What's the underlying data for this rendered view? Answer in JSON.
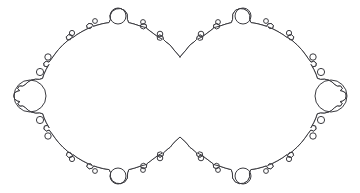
{
  "figure": {
    "kind": "line-drawing",
    "background_color": "#ffffff",
    "stroke_color": "#3b3b40",
    "stroke_width": 1,
    "canvas": {
      "width": 360,
      "height": 193
    }
  },
  "chart_data": {
    "type": "line",
    "subtitle": "",
    "xlabel": "",
    "ylabel": "",
    "grid": false,
    "legend": "none",
    "xlim": [
      0,
      360
    ],
    "ylim": [
      0,
      193
    ],
    "components": [
      {
        "name": "left-main-circle",
        "center": [
          118,
          96
        ],
        "radius": 78
      },
      {
        "name": "right-main-circle",
        "center": [
          243,
          96
        ],
        "radius": 78
      }
    ],
    "cusps": [
      {
        "name": "top-centre-cusp",
        "point": [
          180,
          57
        ]
      },
      {
        "name": "bottom-centre-cusp",
        "point": [
          180,
          137
        ]
      }
    ],
    "major_buds": [
      {
        "name": "left-outer-bud",
        "center": [
          30,
          96
        ],
        "radius": 16
      },
      {
        "name": "right-outer-bud",
        "center": [
          331,
          96
        ],
        "radius": 16
      },
      {
        "name": "left-top-bud",
        "center": [
          118,
          16
        ],
        "radius": 8
      },
      {
        "name": "right-top-bud",
        "center": [
          243,
          16
        ],
        "radius": 8
      },
      {
        "name": "left-bottom-bud",
        "center": [
          118,
          176
        ],
        "radius": 8
      },
      {
        "name": "right-bottom-bud",
        "center": [
          243,
          176
        ],
        "radius": 8
      }
    ],
    "minor_buds": [
      {
        "center": [
          48,
          57
        ],
        "radius": 3.2
      },
      {
        "center": [
          40,
          72
        ],
        "radius": 3.6
      },
      {
        "center": [
          40,
          120
        ],
        "radius": 3.6
      },
      {
        "center": [
          48,
          136
        ],
        "radius": 3.2
      },
      {
        "center": [
          72,
          33
        ],
        "radius": 2.6
      },
      {
        "center": [
          95,
          21
        ],
        "radius": 2.4
      },
      {
        "center": [
          143,
          22
        ],
        "radius": 2.4
      },
      {
        "center": [
          160,
          34
        ],
        "radius": 2.8
      },
      {
        "center": [
          95,
          171
        ],
        "radius": 2.4
      },
      {
        "center": [
          143,
          170
        ],
        "radius": 2.4
      },
      {
        "center": [
          160,
          158
        ],
        "radius": 2.8
      },
      {
        "center": [
          72,
          159
        ],
        "radius": 2.6
      },
      {
        "center": [
          313,
          57
        ],
        "radius": 3.2
      },
      {
        "center": [
          321,
          72
        ],
        "radius": 3.6
      },
      {
        "center": [
          321,
          120
        ],
        "radius": 3.6
      },
      {
        "center": [
          313,
          136
        ],
        "radius": 3.2
      },
      {
        "center": [
          289,
          33
        ],
        "radius": 2.6
      },
      {
        "center": [
          266,
          21
        ],
        "radius": 2.4
      },
      {
        "center": [
          218,
          22
        ],
        "radius": 2.4
      },
      {
        "center": [
          201,
          34
        ],
        "radius": 2.8
      },
      {
        "center": [
          266,
          171
        ],
        "radius": 2.4
      },
      {
        "center": [
          218,
          170
        ],
        "radius": 2.4
      },
      {
        "center": [
          201,
          158
        ],
        "radius": 2.8
      },
      {
        "center": [
          289,
          159
        ],
        "radius": 2.6
      }
    ],
    "path_d": "M 180 57 L 174 50 L 170 45 L 166 42 L 163.5 39.5 L 162.6 36.3 L 159.8 35.0 L 157.2 36.6 L 157.6 39.6 L 160.6 40.4 L 162.4 39.2 L 158 37 L 154 34 L 150 31 L 146.5 28.3 L 146.2 24.8 L 143.4 23.6 L 140.6 25.0 L 140.8 27.9 L 143.6 29.0 L 145.8 27.6 L 140 26 L 134 24 L 128.6 22.6 L 127.4 19.4 L 127.2 14.2 L 124.6 10.4 L 120.4 8.6 L 116.0 9.0 L 112.2 11.4 L 110.2 15.4 L 110.4 19.6 L 109.0 22.6 L 103 23.6 L 97 25.2 L 93.4 26.4 L 92.0 24.0 L 89.0 23.4 L 86.6 25.4 L 87.4 28.2 L 90.4 28.6 L 92.2 26.6 L 87 29 L 82 31.6 L 77 34.6 L 72.6 37.8 L 71.4 35.2 L 68.4 34.8 L 66.2 36.9 L 67.2 39.7 L 70.2 39.8 L 71.8 37.6 L 67 41.2 L 62.6 45.2 L 58.6 49.4 L 55 54 L 51.6 58.8 L 49.0 62.2 L 46.2 61.2 L 43.8 63.0 L 44.2 66.0 L 47.2 66.8 L 49.0 64.4 L 46.2 69.4 L 44.0 74.2 L 42.6 78.4 L 39.4 79.4 L 35.6 79.2 L 31.6 80.0 L 28.0 82.0 L 25.0 84.8 L 22.6 86.2 L 19.4 86.0 L 17.6 88.6 L 19.8 90.6 L 17.0 91.4 L 14.4 93.0 L 14.0 96.0 L 14.6 99.0 L 17.2 100.8 L 20.0 101.6 L 17.8 103.4 L 19.6 106.0 L 22.8 105.8 L 25.2 107.4 L 28.2 110.2 L 31.8 112.2 L 35.8 113.0 L 39.6 112.8 L 42.8 113.8 L 44.2 118.0 L 46.4 122.8 L 49.2 127.8 L 47.4 125.4 L 44.4 126.2 L 44.0 129.2 L 46.4 131.0 L 49.2 130.0 L 51.8 133.4 L 55.2 138.2 L 58.8 142.8 L 62.8 147.0 L 67.2 151.0 L 72.0 154.6 L 70.4 152.4 L 67.4 152.5 L 66.4 155.3 L 68.6 157.4 L 71.6 157.0 L 72.8 154.4 L 77.2 157.6 L 82.2 160.6 L 87.2 163.2 L 92.4 165.6 L 90.6 163.6 L 87.6 164.0 L 86.8 166.8 L 89.2 168.8 L 92.2 168.2 L 93.6 165.8 L 97.2 167.0 L 103.2 168.6 L 109.2 169.6 L 110.6 172.6 L 110.4 176.8 L 112.4 180.8 L 116.2 183.2 L 120.6 183.6 L 124.8 181.8 L 127.4 178.0 L 127.6 172.8 L 128.8 169.6 L 134.2 168.2 L 140.2 166.2 L 146.0 164.6 L 143.8 163.2 L 141.0 164.3 L 140.8 167.2 L 143.6 168.6 L 146.4 167.4 L 146.7 163.9 L 150.2 161.2 L 154.2 158.2 L 158.2 155.2 L 162.6 153.0 L 160.8 151.8 L 157.8 152.6 L 157.4 155.6 L 160.0 157.2 L 162.8 155.9 L 163.7 152.7 L 166.2 150.2 L 170.2 147.2 L 174.2 142.2 L 180 137 L 185.8 142.2 L 189.8 147.2 L 193.8 150.2 L 196.3 152.7 L 197.2 155.9 L 200.0 157.2 L 202.6 155.6 L 202.2 152.6 L 199.2 151.8 L 197.4 153.0 L 201.8 155.2 L 205.8 158.2 L 209.8 161.2 L 213.3 163.9 L 213.6 167.4 L 216.4 168.6 L 219.2 167.2 L 219.0 164.3 L 216.2 163.2 L 214.0 164.6 L 219.8 166.2 L 225.8 168.2 L 231.2 169.6 L 232.4 172.8 L 232.6 178.0 L 235.2 181.8 L 239.4 183.6 L 243.8 183.2 L 247.6 180.8 L 249.6 176.8 L 249.4 172.6 L 250.8 169.6 L 256.8 168.6 L 262.8 167.0 L 266.4 165.8 L 267.8 168.2 L 270.8 168.8 L 273.2 166.8 L 272.4 164.0 L 269.4 163.6 L 267.6 165.6 L 272.8 163.2 L 277.8 160.6 L 282.8 157.6 L 287.2 154.4 L 288.4 157.0 L 291.4 157.4 L 293.6 155.3 L 292.6 152.5 L 289.6 152.4 L 288.0 154.6 L 292.8 151.0 L 297.2 147.0 L 301.2 142.8 L 304.8 138.2 L 308.2 133.4 L 310.8 130.0 L 313.6 131.0 L 316.0 129.2 L 315.6 126.2 L 312.6 125.4 L 310.8 127.8 L 313.6 122.8 L 315.8 118.0 L 317.2 113.8 L 320.4 112.8 L 324.2 113.0 L 328.2 112.2 L 331.8 110.2 L 334.8 107.4 L 337.2 105.8 L 340.4 106.0 L 342.2 103.4 L 340.0 101.6 L 342.8 100.8 L 345.4 99.0 L 346.0 96.0 L 345.6 93.0 L 343.0 91.4 L 340.2 90.6 L 342.4 88.6 L 340.6 86.0 L 337.4 86.2 L 335.0 84.8 L 332.0 82.0 L 328.4 80.0 L 324.4 79.2 L 320.6 79.4 L 317.4 78.4 L 316.0 74.2 L 313.8 69.4 L 311.0 64.4 L 312.8 66.8 L 315.8 66.0 L 316.2 63.0 L 313.8 61.2 L 311.0 62.2 L 308.4 58.8 L 305.0 54.0 L 301.4 49.4 L 297.4 45.2 L 293.0 41.2 L 288.2 37.6 L 289.8 39.8 L 292.8 39.7 L 293.8 36.9 L 291.6 34.8 L 288.6 35.2 L 287.4 37.8 L 283.0 34.6 L 278.0 31.6 L 273.0 29.0 L 267.8 26.6 L 269.6 28.6 L 272.6 28.2 L 273.4 25.4 L 271.0 23.4 L 268.0 24.0 L 266.6 26.4 L 263.0 25.2 L 257.0 23.6 L 251.0 22.6 L 249.6 19.6 L 249.8 15.4 L 247.8 11.4 L 244.0 9.0 L 239.6 8.6 L 235.4 10.4 L 232.8 14.2 L 232.6 19.4 L 231.4 22.6 L 226.0 24.0 L 220.0 26.0 L 214.2 27.6 L 216.4 29.0 L 219.2 27.9 L 219.4 25.0 L 216.6 23.6 L 213.8 24.8 L 213.5 28.3 L 210.0 31.0 L 206.0 34.0 L 202.0 37.0 L 197.6 39.2 L 199.4 40.4 L 202.4 39.6 L 202.8 36.6 L 200.2 35.0 L 197.4 36.3 L 196.5 39.5 L 194.0 42.0 L 190.0 45.0 L 186.0 50.0 L 180 57 Z"
  }
}
